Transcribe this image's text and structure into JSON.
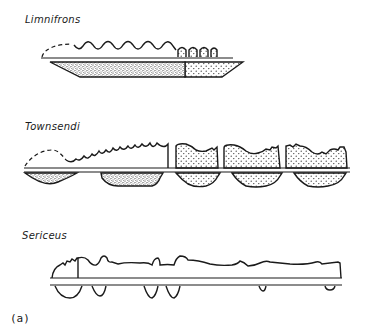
{
  "figure": {
    "panel_label": "(a)",
    "rows": [
      {
        "id": "limnifrons",
        "label": "Limnifrons"
      },
      {
        "id": "townsendi",
        "label": "Townsendi"
      },
      {
        "id": "sericeus",
        "label": "Sericeus"
      }
    ],
    "colors": {
      "ink": "#1a1a1a",
      "background": "#ffffff"
    }
  }
}
